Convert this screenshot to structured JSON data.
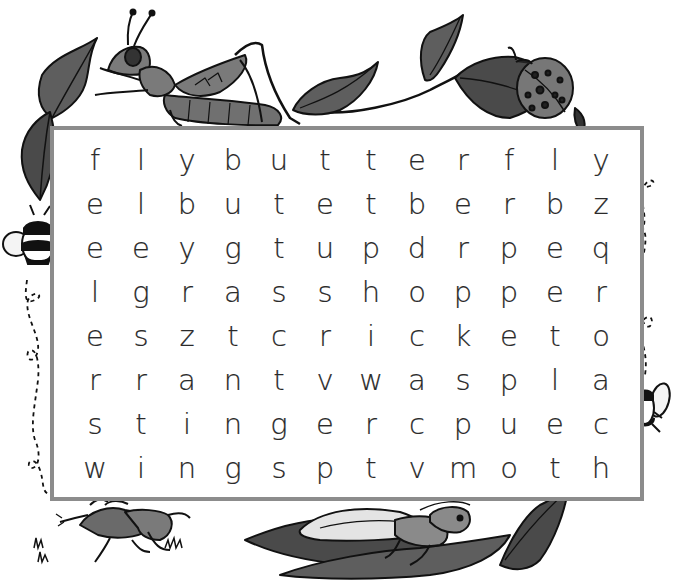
{
  "puzzle": {
    "type": "word-search",
    "rows": 8,
    "cols": 12,
    "grid": [
      [
        "f",
        "l",
        "y",
        "b",
        "u",
        "t",
        "t",
        "e",
        "r",
        "f",
        "l",
        "y"
      ],
      [
        "e",
        "l",
        "b",
        "u",
        "t",
        "e",
        "t",
        "b",
        "e",
        "r",
        "b",
        "z"
      ],
      [
        "e",
        "e",
        "y",
        "g",
        "t",
        "u",
        "p",
        "d",
        "r",
        "p",
        "e",
        "q"
      ],
      [
        "l",
        "g",
        "r",
        "a",
        "s",
        "s",
        "h",
        "o",
        "p",
        "p",
        "e",
        "r"
      ],
      [
        "e",
        "s",
        "z",
        "t",
        "c",
        "r",
        "i",
        "c",
        "k",
        "e",
        "t",
        "o"
      ],
      [
        "r",
        "r",
        "a",
        "n",
        "t",
        "v",
        "w",
        "a",
        "s",
        "p",
        "l",
        "a"
      ],
      [
        "s",
        "t",
        "i",
        "n",
        "g",
        "e",
        "r",
        "c",
        "p",
        "u",
        "e",
        "c"
      ],
      [
        "w",
        "i",
        "n",
        "g",
        "s",
        "p",
        "t",
        "v",
        "m",
        "o",
        "t",
        "h"
      ]
    ],
    "colors": {
      "border": "#8c8c8c",
      "letters": "#2a2a2a",
      "illustration_fill": "#707070",
      "illustration_dark": "#4a4a4a",
      "outline": "#111111"
    }
  },
  "illustrations": [
    {
      "name": "grasshopper",
      "position": "top-left"
    },
    {
      "name": "leaves",
      "position": "top-left-corner"
    },
    {
      "name": "vine-with-leaves",
      "position": "top-center"
    },
    {
      "name": "ladybug",
      "position": "top-right"
    },
    {
      "name": "bee",
      "position": "left-side"
    },
    {
      "name": "dotted-flight-path",
      "position": "left-side"
    },
    {
      "name": "fly",
      "position": "right-side"
    },
    {
      "name": "dotted-flight-path",
      "position": "right-side"
    },
    {
      "name": "cricket",
      "position": "bottom-left"
    },
    {
      "name": "grass-tufts",
      "position": "bottom-left"
    },
    {
      "name": "cricket-on-leaf",
      "position": "bottom-right"
    }
  ]
}
